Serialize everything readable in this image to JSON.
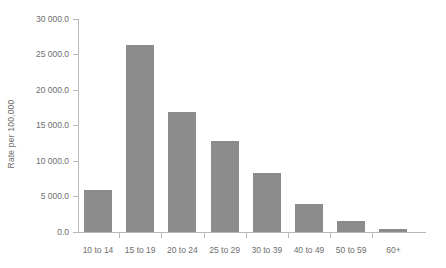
{
  "chart_data": {
    "type": "bar",
    "title": "",
    "xlabel": "",
    "ylabel": "Rate per 100,000",
    "categories": [
      "10 to 14",
      "15 to 19",
      "20 to 24",
      "25 to 29",
      "30 to 39",
      "40 to 49",
      "50 to 59",
      "60+"
    ],
    "values": [
      5900,
      26300,
      16900,
      12800,
      8300,
      3900,
      1500,
      450
    ],
    "ylim": [
      0,
      30000
    ],
    "ytick_values": [
      0,
      5000,
      10000,
      15000,
      20000,
      25000,
      30000
    ],
    "ytick_labels": [
      "0.0",
      "5 000.0",
      "10 000.0",
      "15 000.0",
      "20 000.0",
      "25 000.0",
      "30 000.0"
    ],
    "grid": false,
    "legend": false,
    "bar_color": "#8c8c8c",
    "axis_color": "#b9b9b9",
    "background_color": "#ffffff"
  }
}
